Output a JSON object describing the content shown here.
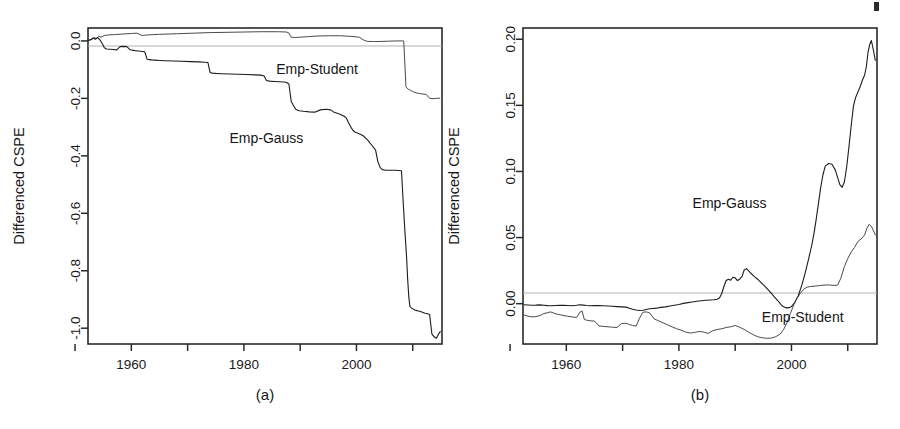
{
  "figure": {
    "background": "#ffffff",
    "ink": "#1d1d1d",
    "zero_line_color": "#b2b2b2"
  },
  "panels": [
    {
      "caption": "(a)",
      "ylabel": "Differenced CSPE",
      "xlabel": "",
      "x_ticks": [
        "",
        "1960",
        "",
        "1980",
        "",
        "2000",
        ""
      ],
      "x_tick_values": [
        1950,
        1960,
        1970,
        1980,
        1990,
        2000,
        2010
      ],
      "x_tick_labeled": [
        1960,
        1980,
        2000
      ],
      "y_ticks": [
        "0.0",
        "-0.2",
        "-0.4",
        "-0.6",
        "-0.8",
        "-1.0"
      ],
      "y_tick_values": [
        0.0,
        -0.2,
        -0.4,
        -0.6,
        -0.8,
        -1.0
      ],
      "annotations": [
        {
          "text": "Emp-Student",
          "x": 1993,
          "y": -0.115
        },
        {
          "text": "Emp-Gauss",
          "x": 1984,
          "y": -0.355
        }
      ]
    },
    {
      "caption": "(b)",
      "ylabel": "Differenced CSPE",
      "xlabel": "",
      "x_ticks": [
        "",
        "1960",
        "",
        "1980",
        "",
        "2000",
        ""
      ],
      "x_tick_values": [
        1950,
        1960,
        1970,
        1980,
        1990,
        2000,
        2010
      ],
      "x_tick_labeled": [
        1960,
        1980,
        2000
      ],
      "y_ticks": [
        "0.20",
        "0.15",
        "0.10",
        "0.05",
        "0.00"
      ],
      "y_tick_values": [
        0.2,
        0.15,
        0.1,
        0.05,
        0.0
      ],
      "annotations": [
        {
          "text": "Emp-Gauss",
          "x": 1989,
          "y": 0.072
        },
        {
          "text": "Emp-Student",
          "x": 2002,
          "y": -0.0135
        }
      ]
    }
  ],
  "chart_data": [
    {
      "type": "line",
      "panel": "(a)",
      "title": "(a)",
      "xlabel": "",
      "ylabel": "Differenced CSPE",
      "xlim": [
        1952.3,
        2015.2
      ],
      "ylim": [
        -1.055,
        0.045
      ],
      "grid": false,
      "legend": "inline-annotations",
      "zero_reference_line": 0.0,
      "series": [
        {
          "name": "Emp-Student",
          "x": [
            1952.4,
            1953.0,
            1953.4,
            1953.8,
            1954.2,
            1954.6,
            1955.2,
            1956.0,
            1957.0,
            1958.5,
            1960.0,
            1961.0,
            1961.6,
            1962.0,
            1962.4,
            1963.0,
            1965.0,
            1968.0,
            1971.0,
            1974.0,
            1977.0,
            1980.0,
            1983.0,
            1986.0,
            1987.6,
            1988.0,
            1988.4,
            1989.0,
            1990.0,
            1991.5,
            1993.0,
            1995.0,
            1997.0,
            1999.0,
            2000.5,
            2001.2,
            2001.8,
            2002.4,
            2003.0,
            2004.0,
            2005.5,
            2007.0,
            2008.4,
            2008.8,
            2009.2,
            2009.6,
            2010.0,
            2010.6,
            2011.2,
            2011.8,
            2012.4,
            2013.0,
            2013.6,
            2014.2,
            2014.8
          ],
          "y": [
            0.003,
            0.006,
            0.012,
            0.008,
            0.016,
            0.013,
            0.019,
            0.021,
            0.022,
            0.024,
            0.026,
            0.027,
            0.021,
            0.019,
            0.02,
            0.021,
            0.023,
            0.025,
            0.027,
            0.029,
            0.03,
            0.031,
            0.032,
            0.032,
            0.031,
            0.027,
            0.013,
            0.012,
            0.013,
            0.015,
            0.017,
            0.018,
            0.018,
            0.016,
            0.013,
            0.004,
            -0.001,
            -0.002,
            -0.002,
            -0.002,
            -0.001,
            0.0,
            0.0,
            -0.16,
            -0.168,
            -0.172,
            -0.176,
            -0.181,
            -0.183,
            -0.185,
            -0.186,
            -0.2,
            -0.201,
            -0.2,
            -0.199
          ]
        },
        {
          "name": "Emp-Gauss",
          "x": [
            1952.4,
            1952.8,
            1953.2,
            1953.6,
            1954.0,
            1954.4,
            1954.8,
            1955.2,
            1955.6,
            1956.2,
            1956.8,
            1957.4,
            1958.0,
            1958.6,
            1959.2,
            1959.8,
            1960.4,
            1960.8,
            1961.2,
            1961.6,
            1962.0,
            1962.4,
            1962.8,
            1963.2,
            1963.6,
            1964.2,
            1965.0,
            1966.0,
            1967.5,
            1969.0,
            1970.5,
            1972.0,
            1973.0,
            1973.6,
            1974.0,
            1974.4,
            1975.0,
            1976.0,
            1977.5,
            1979.0,
            1980.5,
            1982.0,
            1983.0,
            1983.6,
            1984.0,
            1984.6,
            1985.4,
            1986.4,
            1987.2,
            1987.6,
            1988.0,
            1988.4,
            1988.8,
            1989.2,
            1989.8,
            1990.6,
            1991.6,
            1992.6,
            1993.6,
            1994.6,
            1995.4,
            1996.0,
            1996.6,
            1997.2,
            1997.8,
            1998.2,
            1998.6,
            1999.0,
            1999.4,
            1999.8,
            2000.4,
            2001.2,
            2002.0,
            2002.8,
            2003.4,
            2003.8,
            2004.2,
            2004.6,
            2005.2,
            2006.0,
            2007.0,
            2008.0,
            2008.3,
            2008.6,
            2008.9,
            2009.1,
            2009.3,
            2009.5,
            2009.8,
            2010.2,
            2010.6,
            2011.0,
            2011.4,
            2011.8,
            2012.2,
            2012.6,
            2013.0,
            2013.4,
            2013.8,
            2014.2,
            2014.6,
            2014.9
          ],
          "y": [
            0.002,
            0.004,
            0.01,
            0.006,
            0.012,
            0.004,
            -0.008,
            -0.024,
            -0.028,
            -0.029,
            -0.03,
            -0.031,
            -0.02,
            -0.019,
            -0.02,
            -0.031,
            -0.033,
            -0.034,
            -0.035,
            -0.036,
            -0.037,
            -0.038,
            -0.064,
            -0.065,
            -0.066,
            -0.067,
            -0.068,
            -0.069,
            -0.07,
            -0.071,
            -0.072,
            -0.073,
            -0.074,
            -0.075,
            -0.11,
            -0.112,
            -0.113,
            -0.114,
            -0.115,
            -0.116,
            -0.117,
            -0.118,
            -0.119,
            -0.122,
            -0.138,
            -0.14,
            -0.141,
            -0.142,
            -0.143,
            -0.145,
            -0.15,
            -0.21,
            -0.225,
            -0.238,
            -0.243,
            -0.245,
            -0.247,
            -0.248,
            -0.24,
            -0.238,
            -0.24,
            -0.248,
            -0.252,
            -0.256,
            -0.262,
            -0.268,
            -0.285,
            -0.3,
            -0.312,
            -0.318,
            -0.322,
            -0.33,
            -0.345,
            -0.365,
            -0.38,
            -0.42,
            -0.44,
            -0.448,
            -0.45,
            -0.45,
            -0.45,
            -0.452,
            -0.56,
            -0.66,
            -0.75,
            -0.83,
            -0.89,
            -0.925,
            -0.93,
            -0.935,
            -0.938,
            -0.94,
            -0.942,
            -0.945,
            -0.948,
            -0.95,
            -0.952,
            -1.02,
            -1.03,
            -1.035,
            -1.02,
            -1.012,
            -1.01
          ]
        }
      ]
    },
    {
      "type": "line",
      "panel": "(b)",
      "title": "(b)",
      "xlabel": "",
      "ylabel": "Differenced CSPE",
      "xlim": [
        1952.3,
        2015.2
      ],
      "ylim": [
        -0.0305,
        0.2085
      ],
      "grid": false,
      "legend": "inline-annotations",
      "zero_reference_line": 0.0,
      "series": [
        {
          "name": "Emp-Gauss",
          "x": [
            1952.5,
            1953.2,
            1953.9,
            1954.6,
            1955.3,
            1956.0,
            1956.7,
            1957.4,
            1958.1,
            1958.8,
            1959.5,
            1960.2,
            1961.0,
            1961.8,
            1962.4,
            1963.0,
            1963.6,
            1964.2,
            1965.0,
            1965.8,
            1966.6,
            1967.4,
            1968.2,
            1969.0,
            1969.8,
            1970.6,
            1971.2,
            1971.8,
            1972.4,
            1973.0,
            1973.6,
            1974.2,
            1974.8,
            1975.4,
            1976.0,
            1976.8,
            1977.6,
            1978.4,
            1979.2,
            1980.0,
            1980.8,
            1981.6,
            1982.4,
            1983.2,
            1984.0,
            1984.8,
            1985.6,
            1986.2,
            1986.8,
            1987.2,
            1987.6,
            1988.0,
            1988.4,
            1988.8,
            1989.2,
            1989.6,
            1990.0,
            1990.4,
            1990.8,
            1991.2,
            1991.6,
            1992.0,
            1992.4,
            1992.8,
            1993.4,
            1994.0,
            1994.6,
            1995.2,
            1995.8,
            1996.4,
            1997.0,
            1997.6,
            1998.0,
            1998.4,
            1998.8,
            1999.2,
            1999.6,
            2000.0,
            2000.6,
            2001.2,
            2001.8,
            2002.4,
            2003.0,
            2003.6,
            2004.0,
            2004.4,
            2004.8,
            2005.2,
            2005.6,
            2006.0,
            2006.6,
            2007.2,
            2007.8,
            2008.2,
            2008.6,
            2009.0,
            2009.4,
            2009.8,
            2010.2,
            2010.6,
            2011.0,
            2011.4,
            2011.8,
            2012.2,
            2012.6,
            2013.0,
            2013.3,
            2013.6,
            2013.9,
            2014.2,
            2014.5,
            2014.9
          ],
          "y": [
            -0.0008,
            -0.001,
            -0.0012,
            -0.0011,
            -0.0009,
            -0.0012,
            -0.0015,
            -0.0016,
            -0.0014,
            -0.0013,
            -0.0012,
            -0.0014,
            -0.0016,
            -0.0012,
            -0.0008,
            -0.0011,
            -0.0014,
            -0.0016,
            -0.0014,
            -0.0015,
            -0.0016,
            -0.0018,
            -0.002,
            -0.0022,
            -0.0024,
            -0.0026,
            -0.0034,
            -0.0042,
            -0.0048,
            -0.0052,
            -0.005,
            -0.0044,
            -0.0038,
            -0.0036,
            -0.0034,
            -0.0028,
            -0.0024,
            -0.0018,
            -0.0012,
            -0.0006,
            0.0002,
            0.0008,
            0.0013,
            0.0018,
            0.0022,
            0.0026,
            0.0028,
            0.003,
            0.0034,
            0.0042,
            0.0075,
            0.013,
            0.0175,
            0.0185,
            0.0178,
            0.02,
            0.0195,
            0.0175,
            0.0185,
            0.0205,
            0.0255,
            0.0265,
            0.0248,
            0.023,
            0.0205,
            0.0185,
            0.016,
            0.0135,
            0.0108,
            0.008,
            0.005,
            0.0022,
            0.0,
            -0.0018,
            -0.0028,
            -0.0032,
            -0.003,
            -0.0022,
            0.001,
            0.006,
            0.0135,
            0.0225,
            0.033,
            0.044,
            0.053,
            0.064,
            0.076,
            0.088,
            0.0975,
            0.104,
            0.106,
            0.1055,
            0.101,
            0.0955,
            0.09,
            0.088,
            0.092,
            0.103,
            0.118,
            0.134,
            0.149,
            0.156,
            0.16,
            0.164,
            0.169,
            0.173,
            0.179,
            0.19,
            0.196,
            0.199,
            0.193,
            0.184
          ]
        },
        {
          "name": "Emp-Student",
          "x": [
            1952.5,
            1953.2,
            1953.9,
            1954.6,
            1955.3,
            1956.0,
            1956.7,
            1957.2,
            1957.8,
            1958.4,
            1959.0,
            1959.6,
            1960.2,
            1961.0,
            1961.8,
            1962.4,
            1962.8,
            1963.2,
            1963.6,
            1964.0,
            1964.4,
            1965.0,
            1965.8,
            1966.6,
            1967.4,
            1968.2,
            1969.0,
            1969.8,
            1970.6,
            1971.2,
            1971.8,
            1972.4,
            1973.0,
            1973.6,
            1974.2,
            1974.8,
            1975.6,
            1976.4,
            1977.2,
            1978.0,
            1978.8,
            1979.6,
            1980.4,
            1981.2,
            1982.0,
            1982.8,
            1983.6,
            1984.4,
            1985.2,
            1986.0,
            1986.8,
            1987.6,
            1988.4,
            1989.2,
            1990.0,
            1990.8,
            1991.6,
            1992.4,
            1993.2,
            1994.0,
            1994.8,
            1995.6,
            1996.4,
            1997.2,
            1998.0,
            1998.6,
            1999.2,
            1999.8,
            2000.4,
            2001.0,
            2001.6,
            2002.2,
            2002.8,
            2003.4,
            2004.0,
            2004.6,
            2005.2,
            2005.8,
            2006.4,
            2007.0,
            2007.6,
            2008.2,
            2008.8,
            2009.4,
            2010.0,
            2010.6,
            2011.2,
            2011.8,
            2012.4,
            2013.0,
            2013.4,
            2013.8,
            2014.2,
            2014.6,
            2014.9
          ],
          "y": [
            -0.0085,
            -0.0095,
            -0.01,
            -0.0098,
            -0.009,
            -0.0075,
            -0.0068,
            -0.0062,
            -0.0072,
            -0.008,
            -0.0085,
            -0.009,
            -0.0095,
            -0.01,
            -0.0105,
            -0.0065,
            -0.0055,
            -0.012,
            -0.0125,
            -0.0128,
            -0.013,
            -0.0132,
            -0.0168,
            -0.0172,
            -0.0175,
            -0.0178,
            -0.018,
            -0.015,
            -0.0148,
            -0.0158,
            -0.0165,
            -0.017,
            -0.011,
            -0.0065,
            -0.0062,
            -0.007,
            -0.0115,
            -0.013,
            -0.0145,
            -0.016,
            -0.0175,
            -0.019,
            -0.02,
            -0.0215,
            -0.0222,
            -0.0218,
            -0.021,
            -0.0215,
            -0.0225,
            -0.0205,
            -0.0195,
            -0.019,
            -0.018,
            -0.0175,
            -0.0165,
            -0.0178,
            -0.0195,
            -0.0215,
            -0.0235,
            -0.025,
            -0.0258,
            -0.0262,
            -0.026,
            -0.025,
            -0.023,
            -0.0195,
            -0.0145,
            -0.0075,
            -0.001,
            0.004,
            0.008,
            0.011,
            0.0125,
            0.013,
            0.0132,
            0.0135,
            0.0138,
            0.014,
            0.0142,
            0.014,
            0.0138,
            0.014,
            0.0195,
            0.028,
            0.034,
            0.039,
            0.0425,
            0.047,
            0.049,
            0.052,
            0.057,
            0.06,
            0.0585,
            0.055,
            0.052,
            0.0515
          ]
        }
      ]
    }
  ]
}
